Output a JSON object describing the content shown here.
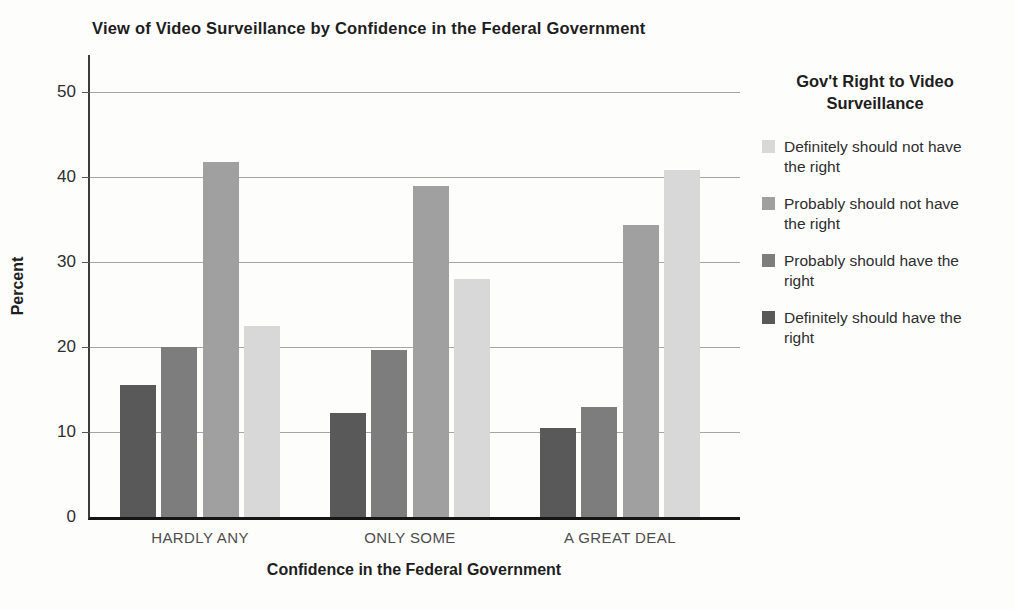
{
  "figure": {
    "background": "#fdfdfc"
  },
  "chart_data": {
    "type": "bar",
    "title": "View of Video Surveillance by Confidence in the Federal Government",
    "xlabel": "Confidence in the Federal Government",
    "ylabel": "Percent",
    "categories": [
      "HARDLY ANY",
      "ONLY SOME",
      "A GREAT DEAL"
    ],
    "series": [
      {
        "name": "Definitely should have the right",
        "color": "#595959",
        "values": [
          15.5,
          12.2,
          10.5
        ]
      },
      {
        "name": "Probably should have the right",
        "color": "#7d7d7d",
        "values": [
          20.0,
          19.7,
          12.9
        ]
      },
      {
        "name": "Probably should not have the right",
        "color": "#a0a0a0",
        "values": [
          41.8,
          38.9,
          34.3
        ]
      },
      {
        "name": "Definitely should not have the right",
        "color": "#d8d8d8",
        "values": [
          22.5,
          28.0,
          40.8
        ]
      }
    ],
    "yticks": [
      0,
      10,
      20,
      30,
      40,
      50
    ],
    "ylim": [
      0,
      54
    ],
    "grid": "horizontal",
    "legend": {
      "title": "Gov't Right to Video Surveillance",
      "position": "right",
      "items": [
        {
          "label": "Definitely should not have the right",
          "color": "#d8d8d8"
        },
        {
          "label": "Probably should not have the right",
          "color": "#a0a0a0"
        },
        {
          "label": "Probably should have the right",
          "color": "#7d7d7d"
        },
        {
          "label": "Definitely should have the right",
          "color": "#595959"
        }
      ]
    }
  }
}
